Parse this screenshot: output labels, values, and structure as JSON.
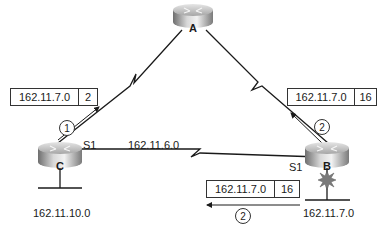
{
  "routers": {
    "a": {
      "label": "A"
    },
    "b": {
      "label": "B"
    },
    "c": {
      "label": "C"
    }
  },
  "interfaces": {
    "c_s1": "S1",
    "b_s1": "S1"
  },
  "networks": {
    "link_c_b": "162.11.6.0",
    "lan_c": "162.11.10.0",
    "lan_b": "162.11.7.0"
  },
  "route_updates": {
    "c_to_a": {
      "network": "162.11.7.0",
      "metric": "2"
    },
    "b_to_a": {
      "network": "162.11.7.0",
      "metric": "16"
    },
    "b_to_c": {
      "network": "162.11.7.0",
      "metric": "16"
    }
  },
  "steps": {
    "c_to_a": "1",
    "b_to_a": "2",
    "b_to_c": "2"
  },
  "colors": {
    "line": "#1a1a1a",
    "router_body": "#a8a8a8",
    "router_top": "#c8c8c8",
    "failure_burst": "#7a7a7a"
  }
}
